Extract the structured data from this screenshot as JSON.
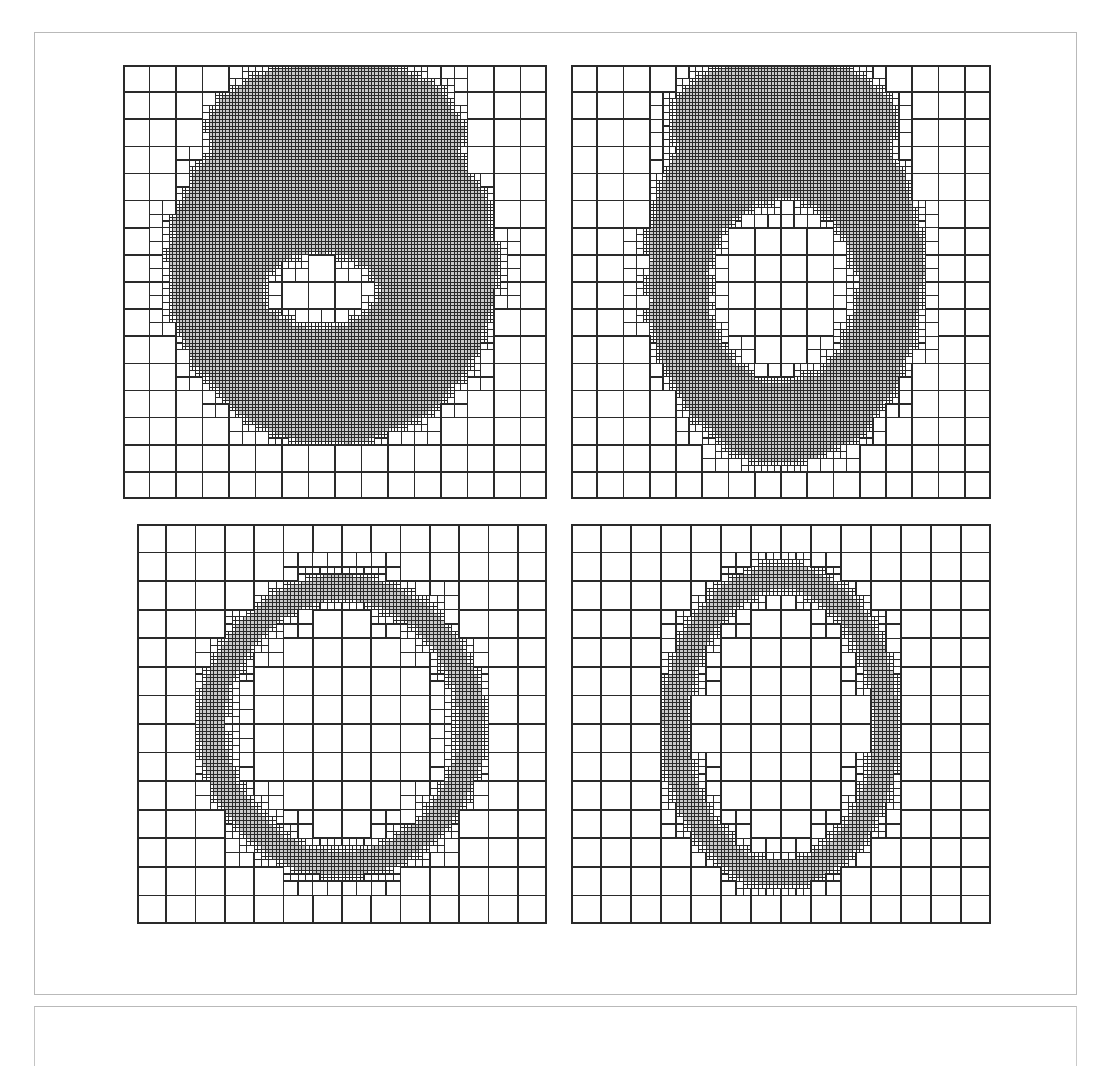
{
  "figure": {
    "panel_count": 4,
    "frame_color": "#b9b9b9",
    "background_color": "#ffffff"
  },
  "caption": {
    "text": ""
  },
  "mesh_style": {
    "line_color": "#2a2a2a",
    "refined_fill": "#c8c8c8",
    "unrefined_fill": "#ffffff",
    "base_line_width": 1.6,
    "fine_line_width": 1.0,
    "border_line_width": 2.0
  },
  "panels": [
    {
      "id": "panel-top-left",
      "label": "top-left",
      "x": 123,
      "y": 65,
      "width": 424,
      "height": 434,
      "base_cells_x": 16,
      "base_cells_y": 16,
      "max_level": 3,
      "shape": "blob-with-hole",
      "shape_params": {
        "outer_cx": 0.495,
        "outer_cy": 0.47,
        "outer_rx": 0.385,
        "outer_ry": 0.4,
        "inner_cx": 0.465,
        "inner_cy": 0.52,
        "inner_rx": 0.14,
        "inner_ry": 0.088,
        "lobe_cx": 0.5,
        "lobe_cy": 0.16,
        "lobe_rx": 0.3,
        "lobe_ry": 0.17,
        "noise": 0.022,
        "seed": 17
      },
      "fill_mode": "solid",
      "refine_band": 1.0
    },
    {
      "id": "panel-top-right",
      "label": "top-right",
      "x": 571,
      "y": 65,
      "width": 420,
      "height": 434,
      "base_cells_x": 16,
      "base_cells_y": 16,
      "max_level": 3,
      "shape": "blob-with-hole",
      "shape_params": {
        "outer_cx": 0.51,
        "outer_cy": 0.48,
        "outer_rx": 0.325,
        "outer_ry": 0.435,
        "inner_cx": 0.505,
        "inner_cy": 0.52,
        "inner_rx": 0.18,
        "inner_ry": 0.215,
        "lobe_cx": 0.505,
        "lobe_cy": 0.135,
        "lobe_rx": 0.265,
        "lobe_ry": 0.15,
        "noise": 0.02,
        "seed": 43
      },
      "fill_mode": "solid",
      "refine_band": 1.0
    },
    {
      "id": "panel-bottom-left",
      "label": "bottom-left",
      "x": 137,
      "y": 524,
      "width": 410,
      "height": 400,
      "base_cells_x": 14,
      "base_cells_y": 14,
      "max_level": 3,
      "shape": "ring",
      "shape_params": {
        "outer_cx": 0.5,
        "outer_cy": 0.505,
        "outer_rx": 0.345,
        "outer_ry": 0.375,
        "inner_cx": 0.5,
        "inner_cy": 0.505,
        "inner_rx": 0.285,
        "inner_ry": 0.315,
        "lobe_cx": 0.5,
        "lobe_cy": 0.16,
        "lobe_rx": 0.175,
        "lobe_ry": 0.06,
        "noise": 0.012,
        "seed": 7
      },
      "fill_mode": "band",
      "refine_band": 0.075
    },
    {
      "id": "panel-bottom-right",
      "label": "bottom-right",
      "x": 571,
      "y": 524,
      "width": 420,
      "height": 400,
      "base_cells_x": 14,
      "base_cells_y": 14,
      "max_level": 3,
      "shape": "ring",
      "shape_params": {
        "outer_cx": 0.5,
        "outer_cy": 0.505,
        "outer_rx": 0.28,
        "outer_ry": 0.4,
        "inner_cx": 0.5,
        "inner_cy": 0.505,
        "inner_rx": 0.222,
        "inner_ry": 0.34,
        "lobe_cx": 0.5,
        "lobe_cy": 0.115,
        "lobe_rx": 0.14,
        "lobe_ry": 0.055,
        "noise": 0.011,
        "seed": 91
      },
      "fill_mode": "band",
      "refine_band": 0.07
    }
  ]
}
